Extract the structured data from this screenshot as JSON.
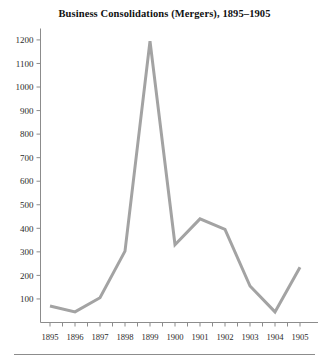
{
  "figure": {
    "title": "Business Consolidations (Mergers), 1895–1905",
    "background_color": "#ffffff",
    "footer_rule_color": "#8c8c8c"
  },
  "chart_data": {
    "type": "line",
    "title": "Business Consolidations (Mergers), 1895–1905",
    "xlabel": "",
    "ylabel": "",
    "categories": [
      "1895",
      "1896",
      "1897",
      "1898",
      "1899",
      "1900",
      "1901",
      "1902",
      "1903",
      "1904",
      "1905"
    ],
    "values": [
      70,
      45,
      105,
      303,
      1195,
      330,
      440,
      395,
      155,
      45,
      235
    ],
    "series": [
      {
        "name": "Business consolidations (mergers)",
        "values": [
          70,
          45,
          105,
          303,
          1195,
          330,
          440,
          395,
          155,
          45,
          235
        ],
        "color": "#a3a3a3",
        "line_width": 3
      }
    ],
    "xtick_labels": [
      "1895",
      "1896",
      "1897",
      "1898",
      "1899",
      "1900",
      "1901",
      "1902",
      "1903",
      "1904",
      "1905"
    ],
    "ytick_labels": [
      "100",
      "200",
      "300",
      "400",
      "500",
      "600",
      "700",
      "800",
      "900",
      "1000",
      "1100",
      "1200"
    ],
    "ytick_values": [
      100,
      200,
      300,
      400,
      500,
      600,
      700,
      800,
      900,
      1000,
      1100,
      1200
    ],
    "ylim": [
      0,
      1240
    ],
    "ystep": 100,
    "grid": false,
    "legend": "none",
    "markers": "none",
    "axis_color": "#8c8c8c",
    "axis_lines": [
      "left",
      "bottom"
    ],
    "peak": {
      "year": "1899",
      "value": 1195
    },
    "minimums": [
      {
        "year": "1896",
        "value": 45
      },
      {
        "year": "1904",
        "value": 45
      }
    ]
  }
}
